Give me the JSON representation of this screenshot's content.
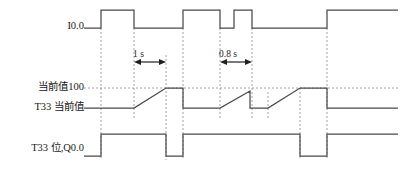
{
  "diagram": {
    "colors": {
      "wave": "#4a4a4a",
      "guide": "#8c8c8c",
      "annotation": "#202020",
      "background": "#ffffff"
    },
    "rows": [
      {
        "id": "i00",
        "label": "I0.0",
        "baseline_y": 28,
        "high_y": 10
      },
      {
        "id": "t33cv",
        "label": "T33 当前值",
        "baseline_y": 108,
        "high_y": 88
      },
      {
        "id": "t33q",
        "label": "T33 位,Q0.0",
        "baseline_y": 156,
        "high_y": 134
      }
    ],
    "level_label": "当前值100",
    "annotations": [
      {
        "id": "dim-1s",
        "text": "1 s",
        "from_x": 134,
        "to_x": 166,
        "y": 62
      },
      {
        "id": "dim-0.8s",
        "text": "0.8 s",
        "from_x": 220,
        "to_x": 252,
        "y": 62
      }
    ],
    "guides_x": [
      101,
      134,
      166,
      183,
      220,
      252,
      268,
      300,
      327
    ],
    "level_line_y": 88,
    "waveforms": {
      "i00": {
        "name": "I0.0",
        "baseline_y": 28,
        "high_y": 10,
        "points": "M 84,28 L 101,28 L 101,10 L 134,10 L 134,28 L 183,28 L 183,10 L 220,10 L 220,28 L 234,28 L 234,10 L 252,10 L 252,28 L 327,28 L 327,10 L 398,10",
        "transitions": [
          {
            "x": 101,
            "edge": "rise"
          },
          {
            "x": 134,
            "edge": "fall"
          },
          {
            "x": 183,
            "edge": "rise"
          },
          {
            "x": 220,
            "edge": "fall"
          },
          {
            "x": 234,
            "edge": "rise"
          },
          {
            "x": 252,
            "edge": "fall"
          },
          {
            "x": 327,
            "edge": "rise"
          }
        ]
      },
      "t33cv": {
        "name": "T33 当前值",
        "baseline_y": 108,
        "high_y": 88,
        "points": "M 84,108 L 134,108 L 166,88 L 183,88 L 183,108 L 220,108 L 250,91 L 250,108 L 268,108 L 300,88 L 327,88 L 327,108 L 398,108",
        "segments": [
          {
            "type": "flat",
            "from_x": 84,
            "to_x": 134,
            "value": 0
          },
          {
            "type": "ramp",
            "from_x": 134,
            "to_x": 166,
            "value_from": 0,
            "value_to": 100
          },
          {
            "type": "flat",
            "from_x": 166,
            "to_x": 183,
            "value": 100
          },
          {
            "type": "reset",
            "from_x": 183,
            "to_x": 220,
            "value": 0
          },
          {
            "type": "ramp",
            "from_x": 220,
            "to_x": 250,
            "value_from": 0,
            "value_to": 80
          },
          {
            "type": "reset",
            "from_x": 250,
            "to_x": 268,
            "value": 0
          },
          {
            "type": "ramp",
            "from_x": 268,
            "to_x": 300,
            "value_from": 0,
            "value_to": 100
          },
          {
            "type": "flat",
            "from_x": 300,
            "to_x": 327,
            "value": 100
          },
          {
            "type": "reset",
            "from_x": 327,
            "to_x": 398,
            "value": 0
          }
        ]
      },
      "t33q": {
        "name": "T33 位,Q0.0",
        "baseline_y": 156,
        "high_y": 134,
        "points": "M 84,156 L 101,156 L 101,134 L 166,134 L 166,156 L 183,156 L 183,134 L 300,134 L 300,156 L 327,156 L 327,134 L 398,134",
        "transitions": [
          {
            "x": 101,
            "edge": "rise"
          },
          {
            "x": 166,
            "edge": "fall"
          },
          {
            "x": 183,
            "edge": "rise"
          },
          {
            "x": 300,
            "edge": "fall"
          },
          {
            "x": 327,
            "edge": "rise"
          }
        ]
      }
    }
  }
}
